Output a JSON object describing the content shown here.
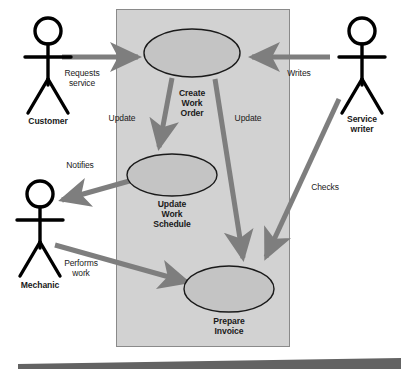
{
  "diagram": {
    "type": "uml-use-case-diagram",
    "title_clipped": "",
    "system_boundary": {
      "name": "system-boundary",
      "fill": "#d2d2d2",
      "stroke": "#8a8a8a",
      "x": 116,
      "y": 9,
      "width": 174,
      "height": 338
    },
    "colors": {
      "ellipse_fill": "#c4c4c4",
      "ellipse_stroke": "#1a1a1a",
      "arrow": "#7e7e7e",
      "actor": "#000000",
      "text": "#1a1a1a",
      "footer_bar": "#636363",
      "background": "#ffffff"
    },
    "use_cases": [
      {
        "id": "create-work-order",
        "label": "Create\nWork\nOrder",
        "cx": 192,
        "cy": 53,
        "rx": 48,
        "ry": 24
      },
      {
        "id": "update-work-schedule",
        "label": "Update\nWork\nSchedule",
        "cx": 172,
        "cy": 175,
        "rx": 45,
        "ry": 21
      },
      {
        "id": "prepare-invoice",
        "label": "Prepare\nInvoice",
        "cx": 229,
        "cy": 289,
        "rx": 45,
        "ry": 23
      }
    ],
    "actors": [
      {
        "id": "customer",
        "label": "Customer",
        "x": 48,
        "y": 22
      },
      {
        "id": "service-writer",
        "label": "Service\nwriter",
        "x": 362,
        "y": 22
      },
      {
        "id": "mechanic",
        "label": "Mechanic",
        "x": 40,
        "y": 185
      }
    ],
    "relationships": [
      {
        "id": "requests-service",
        "label": "Requests\nservice",
        "from": "customer",
        "to": "create-work-order"
      },
      {
        "id": "writes",
        "label": "Writes",
        "from": "service-writer",
        "to": "create-work-order"
      },
      {
        "id": "update-schedule",
        "label": "Update",
        "from": "create-work-order",
        "to": "update-work-schedule"
      },
      {
        "id": "update-invoice",
        "label": "Update",
        "from": "create-work-order",
        "to": "prepare-invoice"
      },
      {
        "id": "notifies",
        "label": "Notifies",
        "from": "update-work-schedule",
        "to": "mechanic"
      },
      {
        "id": "performs-work",
        "label": "Performs\nwork",
        "from": "mechanic",
        "to": "prepare-invoice"
      },
      {
        "id": "checks",
        "label": "Checks",
        "from": "service-writer",
        "to": "prepare-invoice"
      }
    ]
  }
}
